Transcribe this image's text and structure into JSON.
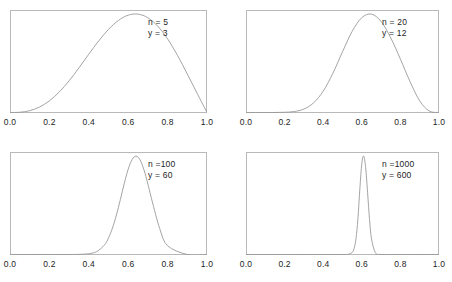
{
  "figure": {
    "width": 452,
    "height": 282,
    "background": "#ffffff",
    "curve_color": "#9a9a9a",
    "frame_color": "#b9b9b9",
    "text_color": "#1e1e1e"
  },
  "axis": {
    "tick_labels": [
      "0.0",
      "0.2",
      "0.4",
      "0.6",
      "0.8",
      "1.0"
    ],
    "tick_values": [
      0.0,
      0.2,
      0.4,
      0.6,
      0.8,
      1.0
    ],
    "xlim": [
      0.0,
      1.0
    ]
  },
  "panels": [
    {
      "id": "panel-top-left",
      "n_label": "n = 5",
      "y_label": "y = 3",
      "n": 5,
      "y": 3,
      "box": {
        "left": 10,
        "top": 10,
        "width": 197,
        "height": 103
      },
      "annotation": {
        "left": 148,
        "top": 17
      }
    },
    {
      "id": "panel-top-right",
      "n_label": "n = 20",
      "y_label": "y = 12",
      "n": 20,
      "y": 12,
      "box": {
        "left": 246,
        "top": 10,
        "width": 193,
        "height": 103
      },
      "annotation": {
        "left": 382,
        "top": 17
      }
    },
    {
      "id": "panel-bottom-left",
      "n_label": "n =100",
      "y_label": "y = 60",
      "n": 100,
      "y": 60,
      "box": {
        "left": 10,
        "top": 152,
        "width": 197,
        "height": 103
      },
      "annotation": {
        "left": 148,
        "top": 159
      }
    },
    {
      "id": "panel-bottom-right",
      "n_label": "n =1000",
      "y_label": "y = 600",
      "n": 1000,
      "y": 600,
      "box": {
        "left": 246,
        "top": 152,
        "width": 193,
        "height": 103
      },
      "annotation": {
        "left": 382,
        "top": 159
      }
    }
  ],
  "chart_data": {
    "type": "line",
    "title": "",
    "xlabel": "",
    "ylabel": "",
    "xlim": [
      0.0,
      1.0
    ],
    "grid": false,
    "legend": "none",
    "xticks": [
      0.0,
      0.2,
      0.4,
      0.6,
      0.8,
      1.0
    ],
    "xticklabels": [
      "0.0",
      "0.2",
      "0.4",
      "0.6",
      "0.8",
      "1.0"
    ],
    "series": [
      {
        "name": "n = 5, y = 3",
        "panel": "panel-top-left",
        "distribution": "beta",
        "alpha": 4,
        "beta": 3,
        "mode": 0.6,
        "annotations": [
          "n = 5",
          "y = 3"
        ],
        "x": [
          0.0,
          0.05,
          0.1,
          0.15,
          0.2,
          0.25,
          0.3,
          0.35,
          0.4,
          0.45,
          0.5,
          0.55,
          0.6,
          0.65,
          0.7,
          0.75,
          0.8,
          0.85,
          0.9,
          0.95,
          1.0
        ],
        "y": [
          0.0,
          0.002,
          0.016,
          0.048,
          0.102,
          0.18,
          0.278,
          0.392,
          0.512,
          0.628,
          0.73,
          0.808,
          0.855,
          0.864,
          0.832,
          0.758,
          0.646,
          0.502,
          0.338,
          0.168,
          0.0
        ]
      },
      {
        "name": "n = 20, y = 12",
        "panel": "panel-top-right",
        "distribution": "beta",
        "alpha": 13,
        "beta": 9,
        "mode": 0.6,
        "annotations": [
          "n = 20",
          "y = 12"
        ],
        "x": [
          0.0,
          0.05,
          0.1,
          0.15,
          0.2,
          0.25,
          0.3,
          0.35,
          0.4,
          0.45,
          0.5,
          0.55,
          0.6,
          0.65,
          0.7,
          0.75,
          0.8,
          0.85,
          0.9,
          0.95,
          1.0
        ],
        "y": [
          0.0,
          0.0,
          0.0,
          0.0,
          0.002,
          0.009,
          0.033,
          0.092,
          0.204,
          0.374,
          0.58,
          0.775,
          0.906,
          0.94,
          0.87,
          0.713,
          0.51,
          0.295,
          0.111,
          0.013,
          0.0
        ]
      },
      {
        "name": "n = 100, y = 60",
        "panel": "panel-bottom-left",
        "distribution": "beta",
        "alpha": 61,
        "beta": 41,
        "mode": 0.6,
        "annotations": [
          "n =100",
          "y = 60"
        ],
        "x": [
          0.0,
          0.1,
          0.2,
          0.3,
          0.35,
          0.4,
          0.44,
          0.48,
          0.5,
          0.52,
          0.54,
          0.56,
          0.58,
          0.6,
          0.62,
          0.64,
          0.66,
          0.68,
          0.7,
          0.72,
          0.76,
          0.8,
          0.9,
          1.0
        ],
        "y": [
          0.0,
          0.0,
          0.0,
          0.0,
          0.001,
          0.006,
          0.023,
          0.077,
          0.133,
          0.212,
          0.316,
          0.44,
          0.57,
          0.685,
          0.763,
          0.79,
          0.76,
          0.68,
          0.566,
          0.438,
          0.208,
          0.07,
          0.0,
          0.0
        ]
      },
      {
        "name": "n = 1000, y = 600",
        "panel": "panel-bottom-right",
        "distribution": "beta",
        "alpha": 601,
        "beta": 401,
        "mode": 0.6,
        "annotations": [
          "n =1000",
          "y = 600"
        ],
        "x": [
          0.0,
          0.2,
          0.4,
          0.5,
          0.53,
          0.55,
          0.56,
          0.57,
          0.58,
          0.59,
          0.6,
          0.61,
          0.62,
          0.63,
          0.64,
          0.65,
          0.67,
          0.7,
          0.8,
          1.0
        ],
        "y": [
          0.0,
          0.0,
          0.0,
          0.0,
          0.002,
          0.02,
          0.06,
          0.16,
          0.36,
          0.66,
          0.91,
          0.985,
          0.87,
          0.62,
          0.35,
          0.16,
          0.02,
          0.0,
          0.0,
          0.0
        ]
      }
    ]
  }
}
